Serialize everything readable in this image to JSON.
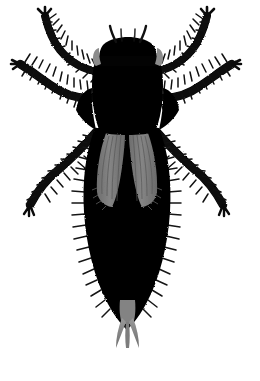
{
  "image": {
    "kind": "natural-image",
    "subject": "thrips-insect-specimen",
    "view": "dorsal",
    "width_px": 260,
    "height_px": 381,
    "background_color": "#ffffff",
    "body_color": "#000000",
    "wing_color": "#7a7a7a",
    "eye_color": "#8c8c8c",
    "cerci_color": "#8a8a8a",
    "hair_color": "#111111",
    "has_text": false,
    "has_labels": false,
    "has_scale_bar": false
  },
  "anatomy": {
    "head": {
      "label": "head",
      "center_x": 128,
      "center_y": 62,
      "width": 52,
      "height": 40
    },
    "antennae": {
      "label": "antennae",
      "count": 2,
      "color": "#1a1a1a",
      "left_tip_x": 110,
      "left_tip_y": 27,
      "right_tip_x": 146,
      "right_tip_y": 27
    },
    "eyes": {
      "label": "compound-eyes",
      "count": 2,
      "color": "#8c8c8c"
    },
    "thorax": {
      "label": "thorax",
      "center_x": 128,
      "center_y": 92,
      "width": 66,
      "height": 66
    },
    "abdomen": {
      "label": "abdomen",
      "center_x": 126,
      "center_y": 215,
      "width": 78,
      "height": 175
    },
    "wings": {
      "label": "fringed-wings",
      "count": 2,
      "color": "#7a7a7a",
      "top_y": 133,
      "bottom_y": 207
    },
    "cerci": {
      "label": "terminal-bristles",
      "count": 2,
      "color": "#8a8a8a",
      "tip_y": 330
    },
    "legs": [
      {
        "label": "foreleg-left",
        "side": "left",
        "pair": "fore",
        "tip_x": 43,
        "tip_y": 12
      },
      {
        "label": "foreleg-right",
        "side": "right",
        "pair": "fore",
        "tip_x": 209,
        "tip_y": 12
      },
      {
        "label": "midleg-left",
        "side": "left",
        "pair": "mid",
        "tip_x": 18,
        "tip_y": 63
      },
      {
        "label": "midleg-right",
        "side": "right",
        "pair": "mid",
        "tip_x": 234,
        "tip_y": 63
      },
      {
        "label": "hindleg-left",
        "side": "left",
        "pair": "hind",
        "tip_x": 26,
        "tip_y": 218
      },
      {
        "label": "hindleg-right",
        "side": "right",
        "pair": "hind",
        "tip_x": 228,
        "tip_y": 218
      }
    ]
  }
}
